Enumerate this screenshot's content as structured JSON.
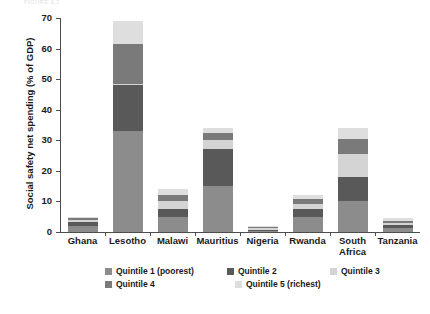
{
  "top_ghost_text": "FIGURE 2.1",
  "chart_data": {
    "type": "bar",
    "stacked": true,
    "title": "",
    "xlabel": "",
    "ylabel": "Social safety net spending (% of GDP)",
    "ylim": [
      0,
      70
    ],
    "yticks": [
      0,
      10,
      20,
      30,
      40,
      50,
      60,
      70
    ],
    "ytick_labels": [
      "0",
      "10",
      "20",
      "30",
      "40",
      "50",
      "60",
      "70"
    ],
    "grid": false,
    "legend_position": "bottom",
    "categories": [
      "Ghana",
      "Lesotho",
      "Malawi",
      "Mauritius",
      "Nigeria",
      "Rwanda",
      "South Africa",
      "Tanzania"
    ],
    "category_lines": [
      [
        "Ghana"
      ],
      [
        "Lesotho"
      ],
      [
        "Malawi"
      ],
      [
        "Mauritius"
      ],
      [
        "Nigeria"
      ],
      [
        "Rwanda"
      ],
      [
        "South",
        "Africa"
      ],
      [
        "Tanzania"
      ]
    ],
    "series": [
      {
        "name": "Quintile 1 (poorest)",
        "color": "#8c8c8c",
        "values": [
          2.0,
          33.0,
          5.0,
          15.0,
          0.4,
          5.0,
          10.0,
          1.2
        ]
      },
      {
        "name": "Quintile 2",
        "color": "#595959",
        "values": [
          1.2,
          15.0,
          2.5,
          12.0,
          0.4,
          2.5,
          8.0,
          1.0
        ]
      },
      {
        "name": "Quintile 3",
        "color": "#d4d4d4",
        "values": [
          0.8,
          0.4,
          2.5,
          3.0,
          0.4,
          1.8,
          7.5,
          0.8
        ]
      },
      {
        "name": "Quintile 4",
        "color": "#7a7a7a",
        "values": [
          0.6,
          13.0,
          2.0,
          2.5,
          0.4,
          1.5,
          5.0,
          0.7
        ]
      },
      {
        "name": "Quintile 5 (richest)",
        "color": "#dedede",
        "values": [
          0.4,
          7.6,
          2.0,
          1.5,
          0.4,
          1.2,
          3.5,
          0.8
        ]
      }
    ],
    "totals": [
      5.0,
      69.0,
      14.0,
      34.0,
      2.0,
      12.0,
      34.0,
      4.5
    ]
  },
  "legend": {
    "rows": [
      [
        {
          "label": "Quintile 1 (poorest)",
          "color": "#8c8c8c",
          "width": 130
        },
        {
          "label": "Quintile 2",
          "color": "#595959",
          "width": 110
        },
        {
          "label": "Quintile 3",
          "color": "#d4d4d4",
          "width": 80
        }
      ],
      [
        {
          "label": "Quintile 4",
          "color": "#7a7a7a",
          "width": 130
        },
        {
          "label": "Quintile 5 (richest)",
          "color": "#dedede",
          "width": 110
        }
      ]
    ]
  }
}
